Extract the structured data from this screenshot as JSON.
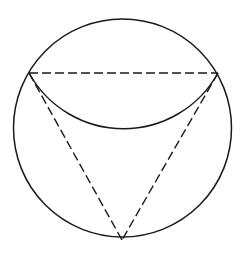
{
  "diagram": {
    "colors": {
      "stroke": "#1a1a1a",
      "background": "#ffffff"
    },
    "circle": {
      "cx": 122.5,
      "cy": 128,
      "r": 109
    },
    "vertices": {
      "top_left": {
        "x": 29,
        "y": 73
      },
      "top_right": {
        "x": 218,
        "y": 73
      },
      "bottom": {
        "x": 122,
        "y": 240
      }
    },
    "inner_arc": {
      "from": "top_left",
      "to": "top_right",
      "r": 108,
      "lowest_y": 129
    },
    "dashed_segments": [
      "top_left-top_right",
      "top_left-bottom",
      "top_right-bottom"
    ],
    "dash_pattern": "9 4"
  }
}
